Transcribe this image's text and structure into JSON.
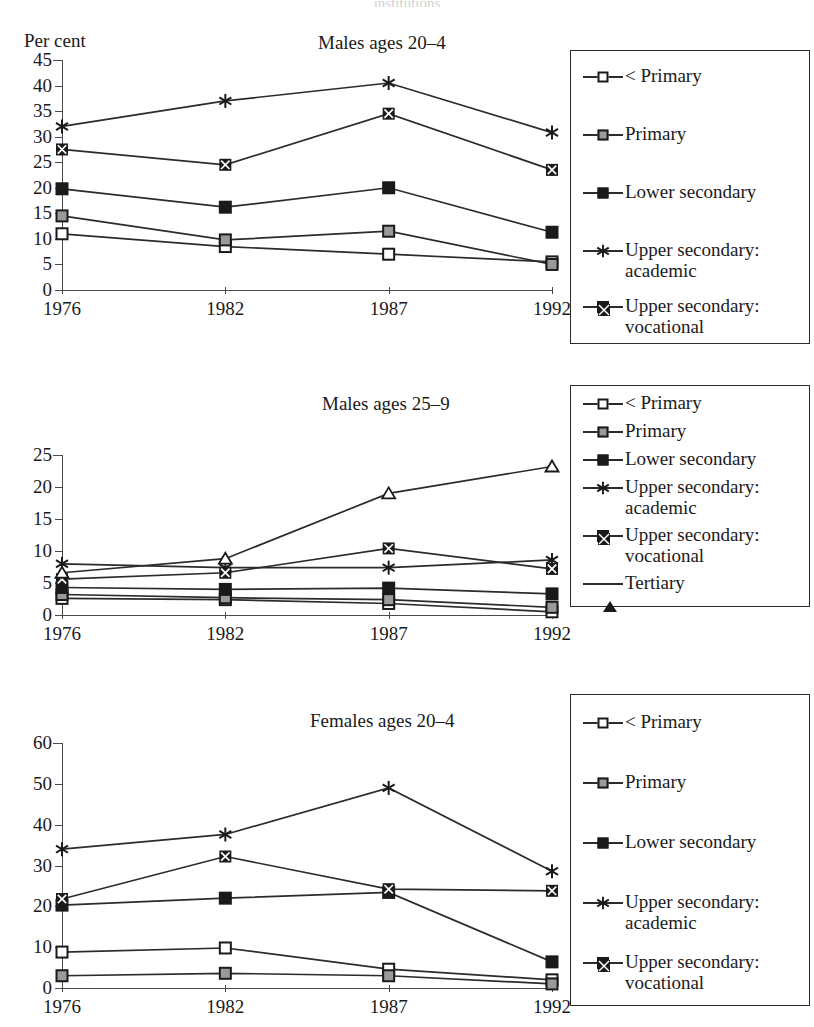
{
  "cut_off_top_title": "institutions",
  "axis_label": "Per cent",
  "x_categories": [
    "1976",
    "1982",
    "1987",
    "1992"
  ],
  "series_names": {
    "lt_primary": "< Primary",
    "primary": "Primary",
    "lower_secondary": "Lower secondary",
    "upper_academic": "Upper secondary:\nacademic",
    "upper_vocational": "Upper secondary:\nvocational",
    "tertiary": "Tertiary"
  },
  "markers": {
    "lt_primary": "open-square-marker",
    "primary": "grey-square-marker",
    "lower_secondary": "black-square-marker",
    "upper_academic": "asterisk-marker",
    "upper_vocational": "crossed-square-marker",
    "tertiary": "open-triangle-marker"
  },
  "colors": {
    "line": "#2b2b2b",
    "axis": "#4a4a4a",
    "marker_open": "#ffffff",
    "marker_grey": "#9a9a9a",
    "marker_black": "#1a1a1a"
  },
  "chart_data": [
    {
      "type": "line",
      "title": "Males ages 20–4",
      "xlabel": "",
      "ylabel": "Per cent",
      "categories": [
        "1976",
        "1982",
        "1987",
        "1992"
      ],
      "ylim": [
        0,
        45
      ],
      "yticks": [
        0,
        5,
        10,
        15,
        20,
        25,
        30,
        35,
        40,
        45
      ],
      "grid": false,
      "legend_position": "right",
      "series": [
        {
          "name": "< Primary",
          "values": [
            11.0,
            8.5,
            7.0,
            5.5
          ]
        },
        {
          "name": "Primary",
          "values": [
            14.5,
            9.8,
            11.5,
            5.0
          ]
        },
        {
          "name": "Lower secondary",
          "values": [
            19.8,
            16.2,
            20.0,
            11.3
          ]
        },
        {
          "name": "Upper secondary: academic",
          "values": [
            32.0,
            37.0,
            40.5,
            30.8
          ]
        },
        {
          "name": "Upper secondary: vocational",
          "values": [
            27.5,
            24.5,
            34.5,
            23.5
          ]
        }
      ]
    },
    {
      "type": "line",
      "title": "Males ages 25–9",
      "xlabel": "",
      "ylabel": "Per cent",
      "categories": [
        "1976",
        "1982",
        "1987",
        "1992"
      ],
      "ylim": [
        0,
        25
      ],
      "yticks": [
        0,
        5,
        10,
        15,
        20,
        25
      ],
      "grid": false,
      "legend_position": "right",
      "series": [
        {
          "name": "< Primary",
          "values": [
            2.6,
            2.4,
            1.8,
            0.5
          ]
        },
        {
          "name": "Primary",
          "values": [
            3.2,
            2.7,
            2.4,
            1.2
          ]
        },
        {
          "name": "Lower secondary",
          "values": [
            4.3,
            4.0,
            4.2,
            3.3
          ]
        },
        {
          "name": "Upper secondary: academic",
          "values": [
            8.0,
            7.4,
            7.4,
            8.6
          ]
        },
        {
          "name": "Upper secondary: vocational",
          "values": [
            5.6,
            6.6,
            10.4,
            7.2
          ]
        },
        {
          "name": "Tertiary",
          "values": [
            6.6,
            8.8,
            19.0,
            23.2
          ]
        }
      ]
    },
    {
      "type": "line",
      "title": "Females ages 20–4",
      "xlabel": "",
      "ylabel": "Per cent",
      "categories": [
        "1976",
        "1982",
        "1987",
        "1992"
      ],
      "ylim": [
        0,
        60
      ],
      "yticks": [
        0,
        10,
        20,
        30,
        40,
        50,
        60
      ],
      "grid": false,
      "legend_position": "right",
      "series": [
        {
          "name": "< Primary",
          "values": [
            8.8,
            9.8,
            4.6,
            2.0
          ]
        },
        {
          "name": "Primary",
          "values": [
            3.0,
            3.6,
            3.0,
            1.0
          ]
        },
        {
          "name": "Lower secondary",
          "values": [
            20.3,
            22.0,
            23.4,
            6.4
          ]
        },
        {
          "name": "Upper secondary: academic",
          "values": [
            34.0,
            37.6,
            49.0,
            28.6
          ]
        },
        {
          "name": "Upper secondary: vocational",
          "values": [
            21.8,
            32.2,
            24.2,
            23.8
          ]
        }
      ]
    }
  ],
  "panels": [
    {
      "title": "Males ages 20–4",
      "title_left": 318,
      "title_top": 10,
      "show_percent_label": true,
      "legend_keys": [
        "lt_primary",
        "primary",
        "lower_secondary",
        "upper_academic",
        "upper_vocational"
      ],
      "legend_row_tops": [
        14,
        72,
        130,
        188,
        244
      ]
    },
    {
      "title": "Males ages 25–9",
      "title_left": 322,
      "title_top": 8,
      "show_percent_label": false,
      "legend_keys": [
        "lt_primary",
        "primary",
        "lower_secondary",
        "upper_academic",
        "upper_vocational",
        "tertiary"
      ],
      "legend_row_tops": [
        6,
        34,
        62,
        90,
        138,
        186
      ]
    },
    {
      "title": "Females ages 20–4",
      "title_left": 310,
      "title_top": 22,
      "show_percent_label": false,
      "legend_keys": [
        "lt_primary",
        "primary",
        "lower_secondary",
        "upper_academic",
        "upper_vocational"
      ],
      "legend_row_tops": [
        16,
        76,
        136,
        196,
        256
      ]
    }
  ]
}
